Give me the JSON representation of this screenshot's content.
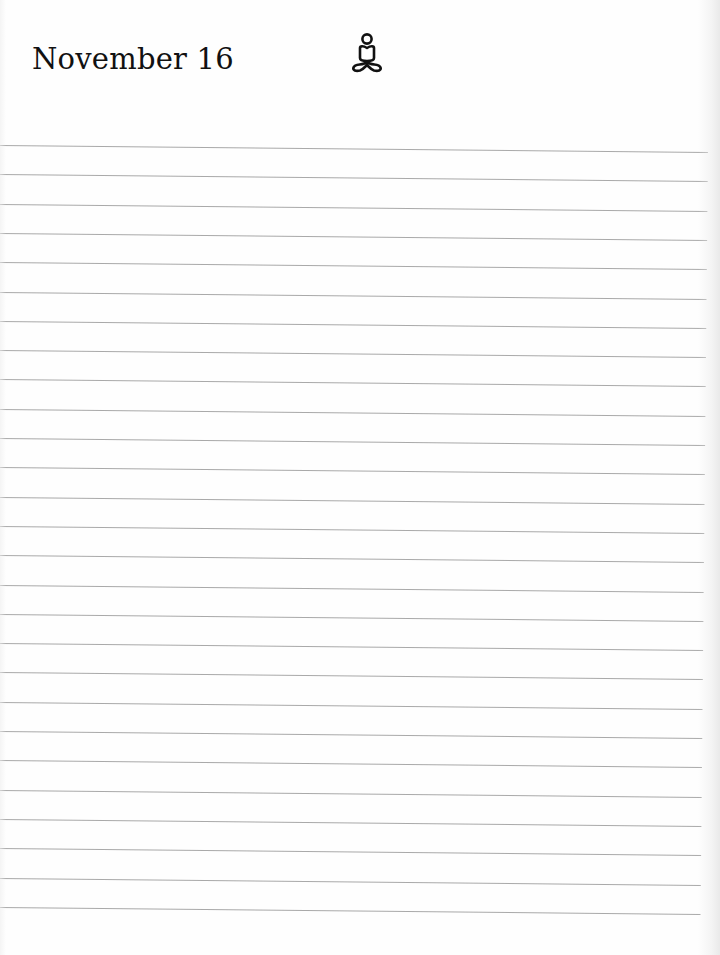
{
  "page": {
    "type": "lined-journal-page",
    "background_color": "#fefefe",
    "line_color": "#9a9a9a"
  },
  "header": {
    "date": "November 16",
    "icon": "meditation-icon"
  },
  "ruled_lines": {
    "count": 27,
    "first_line_y": 145,
    "spacing_px": 29.3
  }
}
